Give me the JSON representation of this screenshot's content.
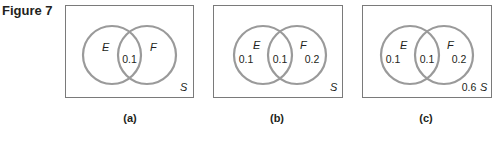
{
  "figure": {
    "title": "Figure 7",
    "colors": {
      "circle_stroke": "#9a9a9a",
      "box_stroke": "#7a7a7a",
      "text": "#231f20"
    },
    "panels": [
      {
        "id": "a",
        "caption": "(a)",
        "set_e_label": "E",
        "set_f_label": "F",
        "universe_label": "S",
        "e_only": "",
        "intersection": "0.1",
        "f_only": "",
        "outside": ""
      },
      {
        "id": "b",
        "caption": "(b)",
        "set_e_label": "E",
        "set_f_label": "F",
        "universe_label": "S",
        "e_only": "0.1",
        "intersection": "0.1",
        "f_only": "0.2",
        "outside": ""
      },
      {
        "id": "c",
        "caption": "(c)",
        "set_e_label": "E",
        "set_f_label": "F",
        "universe_label": "S",
        "e_only": "0.1",
        "intersection": "0.1",
        "f_only": "0.2",
        "outside": "0.6"
      }
    ]
  }
}
